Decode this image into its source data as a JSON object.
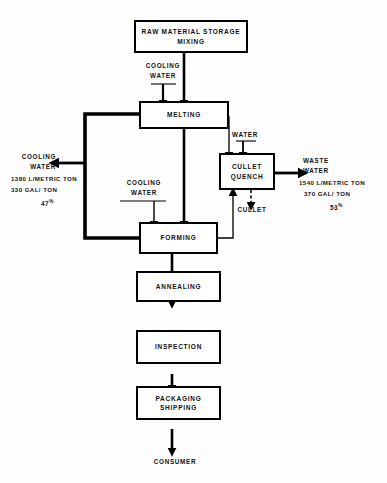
{
  "diagram": {
    "type": "process-flow",
    "nodes": {
      "raw_material": {
        "line1": "RAW MATERIAL STORAGE",
        "line2": "MIXING"
      },
      "melting": {
        "line1": "MELTING"
      },
      "cullet_quench": {
        "line1": "CULLET",
        "line2": "QUENCH"
      },
      "forming": {
        "line1": "FORMING"
      },
      "annealing": {
        "line1": "ANNEALING"
      },
      "inspection": {
        "line1": "INSPECTION"
      },
      "packaging": {
        "line1": "PACKAGING",
        "line2": "SHIPPING"
      }
    },
    "flow_labels": {
      "cooling_water_melting": {
        "line1": "COOLING",
        "line2": "WATER"
      },
      "cooling_water_forming": {
        "line1": "COOLING",
        "line2": "WATER"
      },
      "water_quench": "WATER",
      "cullet_out": "CULLET",
      "consumer": "CONSUMER"
    },
    "streams": {
      "cooling_water_out": {
        "line1": "COOLING",
        "line2": "WATER",
        "metric": "1380  L/METRIC TON",
        "imperial": "330 GAL/ TON",
        "percent": "47",
        "percent_symbol": "%"
      },
      "waste_water_out": {
        "line1": "WASTE",
        "line2": "WATER",
        "metric": "1540 L/METRIC TON",
        "imperial": "370 GAL/ TON",
        "percent": "53",
        "percent_symbol": "%"
      }
    },
    "colors": {
      "line": "#000000",
      "box_fill": "#ffffff",
      "text": "#111111",
      "background": "#fdfdfd"
    }
  }
}
